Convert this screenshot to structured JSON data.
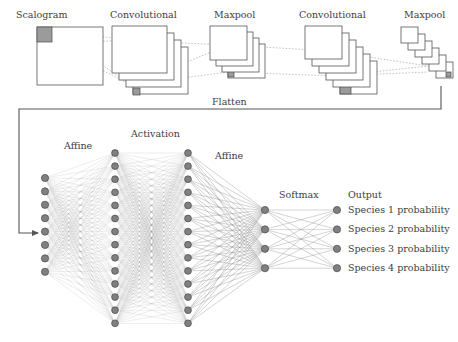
{
  "figure": {
    "style": {
      "background": "#ffffff",
      "stroke": "#555555",
      "node_fill": "#808080",
      "node_stroke": "#4a4a4a",
      "patch_fill": "#9b9b9b",
      "edge_color": "#8a8a8a",
      "dash_color": "#9a9a9a",
      "text_color": "#3d3d3d"
    }
  },
  "cnn": {
    "stages": [
      {
        "id": "scalogram",
        "label": "Scalogram",
        "label_x": 16,
        "label_y": 9,
        "kind": "single-plane",
        "count": 1,
        "x": 37,
        "y": 27,
        "w": 66,
        "h": 58,
        "dx": 0,
        "dy": 0,
        "patch": {
          "x": 0,
          "y": 0,
          "w": 15,
          "h": 15
        }
      },
      {
        "id": "conv-1",
        "label": "Convolutional",
        "label_x": 110,
        "label_y": 9,
        "kind": "stack",
        "count": 4,
        "x": 112,
        "y": 26,
        "w": 55,
        "h": 47,
        "dx": 7,
        "dy": 7,
        "patch": {
          "x": 0,
          "y": 0,
          "w": 6,
          "h": 6
        },
        "patch2": {
          "x": 0,
          "y": 41,
          "w": 7,
          "h": 7
        }
      },
      {
        "id": "maxpool-1",
        "label": "Maxpool",
        "label_x": 214,
        "label_y": 9,
        "kind": "stack",
        "count": 4,
        "x": 210,
        "y": 26,
        "w": 37,
        "h": 34,
        "dx": 6,
        "dy": 6,
        "patch": {
          "x": 0,
          "y": 0,
          "w": 7,
          "h": 7
        },
        "patch2": {
          "x": 0,
          "y": 27,
          "w": 6,
          "h": 6
        }
      },
      {
        "id": "conv-2",
        "label": "Convolutional",
        "label_x": 299,
        "label_y": 9,
        "kind": "stack",
        "count": 6,
        "x": 305,
        "y": 26,
        "w": 37,
        "h": 33,
        "dx": 7,
        "dy": 7,
        "patch": {
          "x": 0,
          "y": 0,
          "w": 5,
          "h": 5
        },
        "patch2": {
          "x": 0,
          "y": 22,
          "w": 11,
          "h": 11
        }
      },
      {
        "id": "maxpool-2",
        "label": "Maxpool",
        "label_x": 404,
        "label_y": 9,
        "kind": "stack",
        "count": 6,
        "x": 401,
        "y": 27,
        "w": 17,
        "h": 16,
        "dx": 7,
        "dy": 7,
        "patch": {
          "x": 10,
          "y": 10,
          "w": 5,
          "h": 5
        }
      }
    ],
    "projection_lines": [
      {
        "from": [
          52,
          30
        ],
        "to": [
          127,
          40
        ]
      },
      {
        "from": [
          52,
          44
        ],
        "to": [
          127,
          40
        ]
      },
      {
        "from": [
          52,
          30
        ],
        "to": [
          131,
          85
        ]
      },
      {
        "from": [
          52,
          44
        ],
        "to": [
          131,
          85
        ]
      },
      {
        "from": [
          131,
          85
        ],
        "to": [
          228,
          45
        ]
      },
      {
        "from": [
          131,
          85
        ],
        "to": [
          228,
          72
        ]
      },
      {
        "from": [
          137,
          41
        ],
        "to": [
          228,
          45
        ]
      },
      {
        "from": [
          228,
          45
        ],
        "to": [
          330,
          51
        ]
      },
      {
        "from": [
          228,
          72
        ],
        "to": [
          335,
          76
        ]
      },
      {
        "from": [
          335,
          76
        ],
        "to": [
          428,
          66
        ]
      },
      {
        "from": [
          335,
          76
        ],
        "to": [
          428,
          72
        ]
      },
      {
        "from": [
          330,
          51
        ],
        "to": [
          428,
          66
        ]
      }
    ]
  },
  "flatten": {
    "label": "Flatten",
    "label_x": 212,
    "label_y": 96,
    "path": "M 441 86 L 441 109 L 19 109 L 19 233 L 38 233",
    "arrow_tip": [
      40,
      233
    ]
  },
  "mlp": {
    "labels": [
      {
        "id": "affine-1",
        "text": "Affine",
        "x": 64,
        "y": 140
      },
      {
        "id": "activation",
        "text": "Activation",
        "x": 131,
        "y": 128
      },
      {
        "id": "affine-2",
        "text": "Affine",
        "x": 215,
        "y": 150
      },
      {
        "id": "softmax",
        "text": "Softmax",
        "x": 279,
        "y": 189
      },
      {
        "id": "output",
        "text": "Output",
        "x": 348,
        "y": 189
      }
    ],
    "layers": [
      {
        "id": "input-layer",
        "name": "flattened-input",
        "x": 45,
        "count": 8,
        "top": 178,
        "gap": 13.4,
        "r": 3.6
      },
      {
        "id": "hidden-1",
        "name": "hidden-layer-1",
        "x": 115,
        "count": 14,
        "top": 153,
        "gap": 13.1,
        "r": 3.4
      },
      {
        "id": "hidden-2",
        "name": "hidden-layer-2",
        "x": 188,
        "count": 14,
        "top": 153,
        "gap": 13.1,
        "r": 3.4
      },
      {
        "id": "softmax-layer",
        "name": "softmax-layer",
        "x": 265,
        "count": 4,
        "top": 210,
        "gap": 19.4,
        "r": 3.6
      },
      {
        "id": "output-layer",
        "name": "output-layer",
        "x": 337,
        "count": 4,
        "top": 210,
        "gap": 19.4,
        "r": 3.6
      }
    ],
    "outputs": [
      {
        "id": "species-1",
        "label": "Species 1 probability",
        "x": 348,
        "y": 204
      },
      {
        "id": "species-2",
        "label": "Species 2 probability",
        "x": 348,
        "y": 223
      },
      {
        "id": "species-3",
        "label": "Species 3 probability",
        "x": 348,
        "y": 243
      },
      {
        "id": "species-4",
        "label": "Species 4 probability",
        "x": 348,
        "y": 262
      }
    ]
  }
}
